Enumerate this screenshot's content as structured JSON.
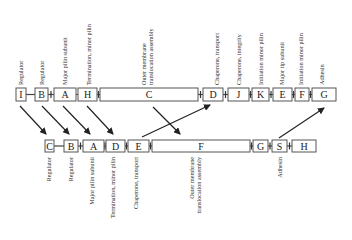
{
  "top_operon": {
    "genes": [
      {
        "letter": "I",
        "function": "Regulator",
        "x": 16,
        "w": 10
      },
      {
        "letter": "B",
        "function": "Regulator",
        "x": 35,
        "w": 13
      },
      {
        "letter": "A",
        "function": "Major pilin subunit",
        "x": 54,
        "w": 22
      },
      {
        "letter": "H",
        "function": "Termination, minor pilin",
        "x": 78,
        "w": 19
      },
      {
        "letter": "C",
        "function_line1": "Outer membrane",
        "function_line2": "translocation assembly",
        "x": 100,
        "w": 98
      },
      {
        "letter": "D",
        "function": "Chaperone, transport",
        "x": 203,
        "w": 20
      },
      {
        "letter": "J",
        "function": "Chaperone, integrity",
        "x": 228,
        "w": 21
      },
      {
        "letter": "K",
        "function": "Initiation minor pilin",
        "x": 252,
        "w": 17
      },
      {
        "letter": "E",
        "function": "Major tip subunit",
        "x": 273,
        "w": 19
      },
      {
        "letter": "F",
        "function": "Initiation minor pilin",
        "x": 295,
        "w": 14
      },
      {
        "letter": "G",
        "function": "Adhesin",
        "x": 312,
        "w": 24
      }
    ]
  },
  "bottom_operon": {
    "genes": [
      {
        "letter": "C",
        "function": "Regulator",
        "x": 45,
        "w": 9
      },
      {
        "letter": "B",
        "function": "Regulator",
        "x": 64,
        "w": 14
      },
      {
        "letter": "A",
        "function": "Major pilin subunit",
        "x": 83,
        "w": 21
      },
      {
        "letter": "D",
        "function": "Termination, minor pilin",
        "x": 106,
        "w": 19
      },
      {
        "letter": "E",
        "function": "Chaperone, transport",
        "x": 128,
        "w": 21
      },
      {
        "letter": "F",
        "function_line1": "Outer membrane",
        "function_line2": "translocation assembly",
        "x": 152,
        "w": 98
      },
      {
        "letter": "G",
        "function": "",
        "x": 253,
        "w": 15
      },
      {
        "letter": "S",
        "function": "Adhesin",
        "x": 272,
        "w": 15
      },
      {
        "letter": "H",
        "function": "",
        "x": 292,
        "w": 24
      }
    ]
  },
  "mappings": [
    {
      "from": "I (top)",
      "to": "C (bottom)"
    },
    {
      "from": "B (top)",
      "to": "B (bottom)"
    },
    {
      "from": "A (top)",
      "to": "A (bottom)"
    },
    {
      "from": "H (top)",
      "to": "D (bottom)"
    },
    {
      "from": "C (top)",
      "to": "F (bottom)"
    },
    {
      "from": "E (bottom)",
      "to": "D (top)"
    },
    {
      "from": "S (bottom)",
      "to": "G (top)"
    }
  ],
  "colors": {
    "stroke": "#555555",
    "text": "#222222",
    "background": "#ffffff"
  }
}
